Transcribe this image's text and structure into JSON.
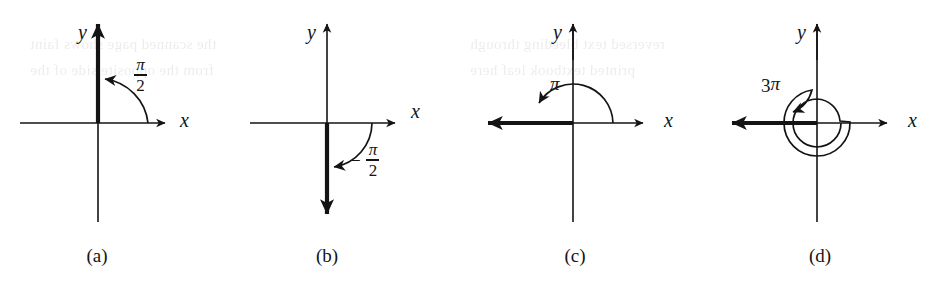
{
  "figure": {
    "panel_count": 4,
    "background_color": "#ffffff",
    "ink_color": "#141414",
    "axis_thin_width": 1.6,
    "axis_thick_width": 4.2
  },
  "panels": [
    {
      "id": "a",
      "caption": "(a)",
      "caption_x": 97,
      "caption_y": 246,
      "origin_x": 98,
      "origin_y": 123,
      "x_axis_label": "x",
      "y_axis_label": "y",
      "x_label_x": 180,
      "x_label_y": 112,
      "y_label_x": 78,
      "y_label_y": 22,
      "angle_text": "pi/2",
      "angle_numerator": "π",
      "angle_denominator": "2",
      "angle_sign": "",
      "angle_coefficient": "",
      "angle_label_x": 134,
      "angle_label_y": 56,
      "angle_radians": 1.5707963,
      "angle_degrees": 90,
      "terminal_side_direction": "up",
      "rotation_direction": "counterclockwise",
      "arc_turns": 0.25,
      "x_axis_left": 20,
      "x_axis_right": 172,
      "y_axis_top": 16,
      "y_axis_bottom": 222
    },
    {
      "id": "b",
      "caption": "(b)",
      "caption_x": 327,
      "caption_y": 246,
      "origin_x": 327,
      "origin_y": 123,
      "x_axis_label": "x",
      "y_axis_label": "y",
      "x_label_x": 411,
      "x_label_y": 103,
      "y_label_x": 307,
      "y_label_y": 22,
      "angle_text": "-pi/2",
      "angle_numerator": "π",
      "angle_denominator": "2",
      "angle_sign": "−",
      "angle_coefficient": "",
      "angle_label_x": 357,
      "angle_label_y": 141,
      "angle_radians": -1.5707963,
      "angle_degrees": -90,
      "terminal_side_direction": "down",
      "rotation_direction": "clockwise",
      "arc_turns": 0.25,
      "x_axis_left": 250,
      "x_axis_right": 402,
      "y_axis_top": 16,
      "y_axis_bottom": 222
    },
    {
      "id": "c",
      "caption": "(c)",
      "caption_x": 575,
      "caption_y": 246,
      "origin_x": 573,
      "origin_y": 123,
      "x_axis_label": "x",
      "y_axis_label": "y",
      "x_label_x": 664,
      "x_label_y": 112,
      "y_label_x": 553,
      "y_label_y": 22,
      "angle_text": "pi",
      "angle_numerator": "",
      "angle_denominator": "",
      "angle_sign": "",
      "angle_coefficient": "",
      "angle_pi_only": "π",
      "angle_label_x": 550,
      "angle_label_y": 74,
      "angle_radians": 3.1415927,
      "angle_degrees": 180,
      "terminal_side_direction": "left",
      "rotation_direction": "counterclockwise",
      "arc_turns": 0.5,
      "x_axis_left": 478,
      "x_axis_right": 650,
      "y_axis_top": 16,
      "y_axis_bottom": 222
    },
    {
      "id": "d",
      "caption": "(d)",
      "caption_x": 820,
      "caption_y": 246,
      "origin_x": 817,
      "origin_y": 123,
      "x_axis_label": "x",
      "y_axis_label": "y",
      "x_label_x": 908,
      "x_label_y": 112,
      "y_label_x": 797,
      "y_label_y": 22,
      "angle_text": "3pi",
      "angle_numerator": "",
      "angle_denominator": "",
      "angle_sign": "",
      "angle_coefficient": "3",
      "angle_pi_only": "π",
      "angle_label_x": 761,
      "angle_label_y": 74,
      "angle_radians": 9.424778,
      "angle_degrees": 540,
      "terminal_side_direction": "left",
      "rotation_direction": "counterclockwise",
      "arc_turns": 1.5,
      "x_axis_left": 722,
      "x_axis_right": 894,
      "y_axis_top": 16,
      "y_axis_bottom": 222,
      "spiral_inner_radius": 24,
      "spiral_outer_radius": 33
    }
  ],
  "bleed_through_text": [
    {
      "text": "the scanned page shows faint",
      "x": 30,
      "y": 44
    },
    {
      "text": "reversed text bleeding through",
      "x": 470,
      "y": 44
    },
    {
      "text": "from the opposite side of the",
      "x": 30,
      "y": 70
    },
    {
      "text": "printed textbook leaf here",
      "x": 470,
      "y": 70
    }
  ]
}
